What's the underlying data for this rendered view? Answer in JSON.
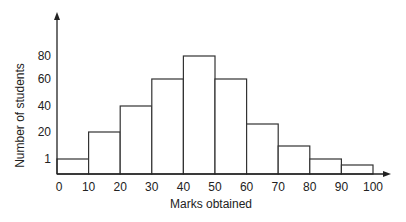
{
  "chart_data": {
    "type": "bar",
    "subtype": "histogram",
    "title": "",
    "xlabel": "Marks obtained",
    "ylabel": "Number of students",
    "bins": [
      [
        0,
        10
      ],
      [
        10,
        20
      ],
      [
        20,
        30
      ],
      [
        30,
        40
      ],
      [
        40,
        50
      ],
      [
        50,
        60
      ],
      [
        60,
        70
      ],
      [
        70,
        80
      ],
      [
        80,
        90
      ],
      [
        90,
        100
      ]
    ],
    "categories": [
      "0-10",
      "10-20",
      "20-30",
      "30-40",
      "40-50",
      "50-60",
      "60-70",
      "70-80",
      "80-90",
      "90-100"
    ],
    "values": [
      1,
      20,
      40,
      60,
      80,
      60,
      25,
      10,
      1,
      0.5
    ],
    "x_ticks": [
      "0",
      "10",
      "20",
      "30",
      "40",
      "50",
      "60",
      "70",
      "80",
      "90",
      "100"
    ],
    "y_ticks": [
      "1",
      "20",
      "40",
      "60",
      "80"
    ],
    "y_tick_values": [
      1,
      20,
      40,
      60,
      80
    ],
    "xlim": [
      0,
      100
    ],
    "grid": false,
    "legend": null,
    "bar_fill": "#ffffff",
    "bar_edge": "#333333",
    "axis_color": "#222222"
  },
  "layout_px": {
    "origin_x": 57,
    "baseline_y": 174,
    "x_axis_end": 391,
    "y_axis_top": 12,
    "px_per_bin": 31.6,
    "bar_top_y": [
      159,
      132,
      106,
      79,
      56,
      79,
      124,
      146,
      159,
      165
    ],
    "y_tick_y": [
      159,
      132,
      106,
      79,
      56
    ]
  }
}
